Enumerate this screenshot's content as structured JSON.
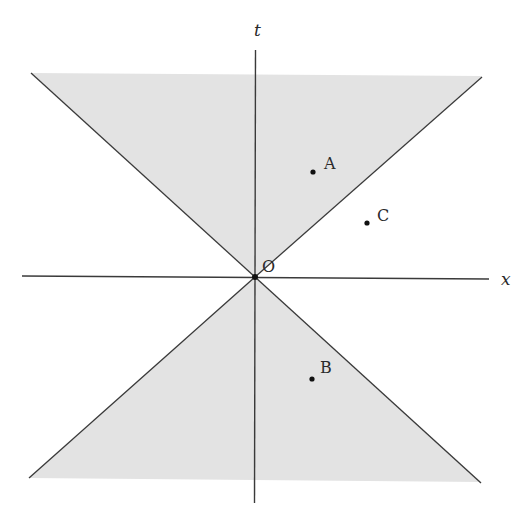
{
  "diagram": {
    "colors": {
      "background": "#ffffff",
      "cone_fill": "#e3e3e3",
      "line": "#3a3a3a",
      "point": "#111111",
      "text": "#2a2a2a"
    },
    "axes": {
      "vertical_label": "t",
      "horizontal_label": "x"
    },
    "origin": {
      "label": "O"
    },
    "points": [
      {
        "label": "A",
        "region": "future light cone (timelike)"
      },
      {
        "label": "C",
        "region": "outside light cone (spacelike)"
      },
      {
        "label": "B",
        "region": "past light cone (timelike)"
      }
    ]
  }
}
